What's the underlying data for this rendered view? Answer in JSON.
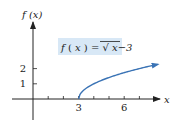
{
  "chart_data": {
    "type": "line",
    "title": "",
    "function_label": {
      "prefix": "f",
      "paren_open": "(",
      "arg": "x",
      "paren_close": ")",
      "equals": " = ",
      "radicand": "x−3"
    },
    "xlabel": "x",
    "ylabel": "f (x)",
    "xlim": [
      -1.5,
      8.5
    ],
    "ylim": [
      -1.5,
      6.0
    ],
    "x_ticks": [
      1,
      2,
      3,
      4,
      5,
      6,
      7
    ],
    "x_tick_labels": [
      {
        "value": 3,
        "label": "3"
      },
      {
        "value": 6,
        "label": "6"
      }
    ],
    "y_ticks": [
      1,
      2
    ],
    "y_tick_labels": [
      {
        "value": 1,
        "label": "1"
      },
      {
        "value": 2,
        "label": "2"
      }
    ],
    "series": [
      {
        "name": "f(x) = sqrt(x-3)",
        "domain": [
          3,
          8.2
        ],
        "sample_points": [
          {
            "x": 3,
            "y": 0
          },
          {
            "x": 4,
            "y": 1
          },
          {
            "x": 5,
            "y": 1.414
          },
          {
            "x": 6,
            "y": 1.732
          },
          {
            "x": 7,
            "y": 2
          },
          {
            "x": 8.2,
            "y": 2.28
          }
        ],
        "end_arrow": true,
        "color": "#3a73b5"
      }
    ],
    "grid": false,
    "legend": "none",
    "annotation_box_color": "#d8e8f6"
  }
}
